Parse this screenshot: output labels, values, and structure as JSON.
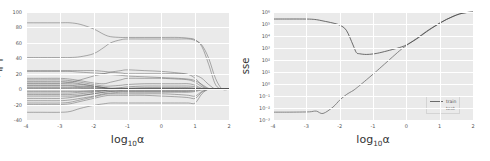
{
  "figure": {
    "panels": [
      "coefficient-path",
      "sse-curve"
    ],
    "background": "#ffffff",
    "plot_background": "#eaeaea",
    "grid_color": "#ffffff",
    "tick_color": "#555555"
  },
  "left_panel": {
    "ylabel": "계수",
    "xlabel_base": "log",
    "xlabel_sub": "10",
    "xlabel_var": "α",
    "yticks": [
      "100",
      "80",
      "60",
      "40",
      "20",
      "0",
      "-20",
      "-40"
    ],
    "xticks": [
      "-4",
      "-3",
      "-2",
      "-1",
      "0",
      "1",
      "2"
    ]
  },
  "right_panel": {
    "ylabel": "sse",
    "xlabel_base": "log",
    "xlabel_sub": "10",
    "xlabel_var": "α",
    "yticks": [
      "10⁶",
      "10⁵",
      "10⁴",
      "10³",
      "10²",
      "10¹",
      "10⁰",
      "10⁻¹",
      "10⁻²",
      "10⁻³"
    ],
    "xticks": [
      "-4",
      "-3",
      "-2",
      "-1",
      "0",
      "1",
      "2"
    ],
    "legend": {
      "train_label": "train",
      "test_label": "test",
      "train_color": "#6b6b6b",
      "test_color": "#4a4a4a"
    }
  },
  "chart_data": [
    {
      "type": "line",
      "id": "coefficient-path",
      "title": "",
      "xlabel": "log10(alpha)",
      "ylabel": "계수",
      "xlim": [
        -4,
        2
      ],
      "ylim": [
        -40,
        100
      ],
      "grid": true,
      "legend_position": "none",
      "x": [
        -4.0,
        -3.5,
        -3.0,
        -2.7,
        -2.4,
        -2.0,
        -1.7,
        -1.5,
        -1.2,
        -1.0,
        -0.5,
        0.0,
        0.5,
        0.8,
        1.0,
        1.2,
        1.4,
        1.6,
        1.8,
        2.0
      ],
      "series": [
        {
          "name": "coef-01",
          "values": [
            86,
            86,
            86,
            86,
            84,
            78,
            71,
            68,
            67,
            67,
            67,
            67,
            67,
            66,
            64,
            55,
            32,
            6,
            0,
            0
          ]
        },
        {
          "name": "coef-02",
          "values": [
            41,
            41,
            41,
            41,
            42,
            46,
            54,
            60,
            64,
            65,
            65,
            65,
            65,
            65,
            63,
            57,
            40,
            14,
            0,
            0
          ]
        },
        {
          "name": "coef-03",
          "values": [
            24,
            24,
            24,
            24,
            24,
            24,
            23,
            22,
            21,
            20,
            20,
            20,
            20,
            19,
            18,
            14,
            6,
            0,
            0,
            0
          ]
        },
        {
          "name": "coef-04",
          "values": [
            23,
            23,
            23,
            23,
            22,
            21,
            20,
            19,
            18,
            17,
            16,
            15,
            14,
            13,
            11,
            6,
            1,
            0,
            0,
            0
          ]
        },
        {
          "name": "coef-05",
          "values": [
            8,
            8,
            8,
            9,
            12,
            17,
            20,
            22,
            24,
            25,
            24,
            23,
            21,
            19,
            14,
            5,
            0,
            0,
            0,
            0
          ]
        },
        {
          "name": "coef-06",
          "values": [
            14,
            14,
            14,
            13,
            11,
            8,
            7,
            9,
            12,
            14,
            14,
            14,
            13,
            12,
            9,
            3,
            0,
            0,
            0,
            0
          ]
        },
        {
          "name": "coef-07",
          "values": [
            12,
            12,
            12,
            11,
            9,
            6,
            4,
            4,
            5,
            6,
            7,
            7,
            7,
            7,
            5,
            1,
            0,
            0,
            0,
            0
          ]
        },
        {
          "name": "coef-08",
          "values": [
            10,
            10,
            10,
            9,
            7,
            4,
            2,
            1,
            2,
            3,
            4,
            4,
            4,
            4,
            3,
            0,
            0,
            0,
            0,
            0
          ]
        },
        {
          "name": "coef-09",
          "values": [
            7,
            7,
            7,
            7,
            6,
            4,
            2,
            1,
            1,
            1,
            2,
            2,
            2,
            2,
            1,
            0,
            0,
            0,
            0,
            0
          ]
        },
        {
          "name": "coef-10",
          "values": [
            5,
            5,
            5,
            5,
            4,
            3,
            2,
            1,
            1,
            1,
            1,
            1,
            1,
            1,
            1,
            0,
            0,
            0,
            0,
            0
          ]
        },
        {
          "name": "coef-11",
          "values": [
            4,
            4,
            4,
            4,
            3,
            2,
            1,
            0,
            0,
            0,
            0,
            0,
            0,
            0,
            0,
            0,
            0,
            0,
            0,
            0
          ]
        },
        {
          "name": "coef-12",
          "values": [
            2,
            2,
            2,
            2,
            2,
            1,
            1,
            0,
            0,
            0,
            0,
            0,
            0,
            0,
            0,
            0,
            0,
            0,
            0,
            0
          ]
        },
        {
          "name": "coef-13",
          "values": [
            1,
            1,
            1,
            1,
            1,
            0,
            0,
            0,
            0,
            0,
            0,
            0,
            0,
            0,
            0,
            0,
            0,
            0,
            0,
            0
          ]
        },
        {
          "name": "coef-14",
          "values": [
            0,
            0,
            0,
            0,
            0,
            0,
            0,
            0,
            0,
            0,
            0,
            0,
            0,
            0,
            0,
            0,
            0,
            0,
            0,
            0
          ]
        },
        {
          "name": "coef-15",
          "values": [
            -1,
            -1,
            -1,
            -1,
            -1,
            -1,
            -1,
            0,
            0,
            0,
            0,
            0,
            0,
            0,
            0,
            0,
            0,
            0,
            0,
            0
          ]
        },
        {
          "name": "coef-16",
          "values": [
            -3,
            -3,
            -3,
            -3,
            -3,
            -2,
            -1,
            -1,
            0,
            0,
            0,
            0,
            0,
            0,
            0,
            0,
            0,
            0,
            0,
            0
          ]
        },
        {
          "name": "coef-17",
          "values": [
            -5,
            -5,
            -5,
            -5,
            -4,
            -3,
            -2,
            -1,
            -1,
            0,
            0,
            0,
            0,
            0,
            0,
            0,
            0,
            0,
            0,
            0
          ]
        },
        {
          "name": "coef-18",
          "values": [
            -7,
            -7,
            -7,
            -7,
            -6,
            -4,
            -2,
            -1,
            -1,
            -1,
            -1,
            -1,
            -1,
            -1,
            0,
            0,
            0,
            0,
            0,
            0
          ]
        },
        {
          "name": "coef-19",
          "values": [
            -9,
            -9,
            -9,
            -9,
            -8,
            -6,
            -4,
            -3,
            -2,
            -2,
            -2,
            -2,
            -2,
            -2,
            -1,
            0,
            0,
            0,
            0,
            0
          ]
        },
        {
          "name": "coef-20",
          "values": [
            -12,
            -12,
            -12,
            -11,
            -9,
            -6,
            -4,
            -3,
            -3,
            -3,
            -3,
            -3,
            -3,
            -3,
            -2,
            0,
            0,
            0,
            0,
            0
          ]
        },
        {
          "name": "coef-21",
          "values": [
            -15,
            -15,
            -15,
            -14,
            -12,
            -9,
            -6,
            -5,
            -4,
            -4,
            -4,
            -4,
            -4,
            -4,
            -3,
            -1,
            0,
            0,
            0,
            0
          ]
        },
        {
          "name": "coef-22",
          "values": [
            -18,
            -18,
            -18,
            -17,
            -14,
            -10,
            -7,
            -6,
            -6,
            -6,
            -6,
            -6,
            -7,
            -8,
            -9,
            -3,
            0,
            0,
            0,
            0
          ]
        },
        {
          "name": "coef-23",
          "values": [
            -20,
            -20,
            -20,
            -19,
            -16,
            -12,
            -9,
            -8,
            -8,
            -8,
            -8,
            -9,
            -10,
            -11,
            -12,
            -4,
            0,
            0,
            0,
            0
          ]
        },
        {
          "name": "coef-24",
          "values": [
            -30,
            -30,
            -30,
            -29,
            -25,
            -21,
            -19,
            -18,
            -18,
            -18,
            -18,
            -18,
            -18,
            -18,
            -18,
            -6,
            0,
            0,
            0,
            0
          ]
        }
      ]
    },
    {
      "type": "line",
      "id": "sse-curve",
      "title": "",
      "xlabel": "log10(alpha)",
      "ylabel": "sse",
      "xlim": [
        -4,
        2
      ],
      "ylim": [
        0.001,
        1000000
      ],
      "yscale": "log",
      "grid": true,
      "legend_position": "lower-right",
      "x": [
        -4.0,
        -3.6,
        -3.2,
        -2.9,
        -2.7,
        -2.5,
        -2.2,
        -2.0,
        -1.8,
        -1.6,
        -1.5,
        -1.4,
        -1.2,
        -1.0,
        -0.8,
        -0.5,
        -0.2,
        0.0,
        0.3,
        0.6,
        0.8,
        1.0,
        1.2,
        1.4,
        1.6,
        1.8,
        2.0
      ],
      "series": [
        {
          "name": "train",
          "values": [
            0.0045,
            0.0045,
            0.0046,
            0.0048,
            0.0055,
            0.0035,
            0.012,
            0.045,
            0.13,
            0.28,
            0.45,
            0.75,
            2.2,
            6.5,
            20,
            110,
            600,
            1600,
            6000,
            24000,
            55000,
            120000,
            240000,
            430000,
            700000,
            900000,
            1000000
          ]
        },
        {
          "name": "test",
          "values": [
            260000,
            260000,
            260000,
            255000,
            230000,
            180000,
            120000,
            80000,
            30000,
            1800,
            420,
            330,
            290,
            320,
            400,
            650,
            1100,
            1800,
            5500,
            22000,
            52000,
            115000,
            235000,
            425000,
            690000,
            890000,
            1000000
          ]
        }
      ]
    }
  ]
}
